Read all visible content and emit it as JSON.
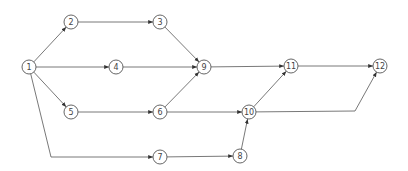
{
  "diagram": {
    "type": "directed-network",
    "stroke_color": "#555555",
    "node_radius": 7,
    "nodes": [
      {
        "id": "1",
        "label": "1",
        "x": 29,
        "y": 67
      },
      {
        "id": "2",
        "label": "2",
        "x": 71,
        "y": 22
      },
      {
        "id": "3",
        "label": "3",
        "x": 160,
        "y": 22
      },
      {
        "id": "4",
        "label": "4",
        "x": 116,
        "y": 67
      },
      {
        "id": "5",
        "label": "5",
        "x": 71,
        "y": 112
      },
      {
        "id": "6",
        "label": "6",
        "x": 160,
        "y": 112
      },
      {
        "id": "7",
        "label": "7",
        "x": 160,
        "y": 157
      },
      {
        "id": "8",
        "label": "8",
        "x": 240,
        "y": 156
      },
      {
        "id": "9",
        "label": "9",
        "x": 204,
        "y": 67
      },
      {
        "id": "10",
        "label": "10",
        "x": 249,
        "y": 112
      },
      {
        "id": "11",
        "label": "11",
        "x": 291,
        "y": 66
      },
      {
        "id": "12",
        "label": "12",
        "x": 380,
        "y": 66
      }
    ],
    "edges": [
      {
        "from": "1",
        "to": "2"
      },
      {
        "from": "1",
        "to": "4"
      },
      {
        "from": "1",
        "to": "5"
      },
      {
        "from": "1",
        "to": "7",
        "via": [
          [
            51,
            157
          ]
        ]
      },
      {
        "from": "2",
        "to": "3"
      },
      {
        "from": "3",
        "to": "9"
      },
      {
        "from": "4",
        "to": "9"
      },
      {
        "from": "5",
        "to": "6"
      },
      {
        "from": "6",
        "to": "9"
      },
      {
        "from": "6",
        "to": "10"
      },
      {
        "from": "7",
        "to": "8"
      },
      {
        "from": "8",
        "to": "10"
      },
      {
        "from": "9",
        "to": "11"
      },
      {
        "from": "10",
        "to": "11"
      },
      {
        "from": "10",
        "to": "12",
        "via": [
          [
            355,
            111
          ]
        ]
      },
      {
        "from": "11",
        "to": "12"
      }
    ]
  }
}
